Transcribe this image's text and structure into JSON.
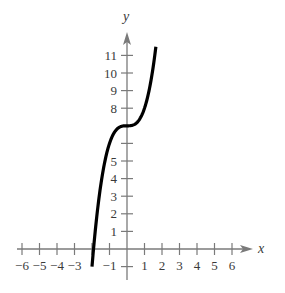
{
  "chart_data": {
    "type": "line",
    "title": "",
    "xlabel": "x",
    "ylabel": "y",
    "xlim": [
      -6.5,
      7.2
    ],
    "ylim": [
      -1.5,
      12
    ],
    "grid": false,
    "legend": null,
    "x_ticks": [
      -6,
      -5,
      -4,
      -3,
      -2,
      -1,
      1,
      2,
      3,
      4,
      5,
      6
    ],
    "x_tick_labels": [
      "-6",
      "-5",
      "-4",
      "-3",
      "",
      "-1",
      "1",
      "2",
      "3",
      "4",
      "5",
      "6"
    ],
    "y_ticks": [
      -1,
      1,
      2,
      3,
      4,
      5,
      6,
      7,
      8,
      9,
      10,
      11
    ],
    "y_tick_labels": [
      "",
      "1",
      "2",
      "3",
      "4",
      "5",
      "",
      "",
      "8",
      "9",
      "10",
      "11"
    ],
    "series": [
      {
        "name": "f(x) = x^3 + 7",
        "function": "x^3 + 7",
        "x_range": [
          -2.0,
          1.65
        ],
        "points": [
          [
            -2.0,
            -1.0
          ],
          [
            -1.9,
            0.14
          ],
          [
            -1.75,
            1.64
          ],
          [
            -1.5,
            3.63
          ],
          [
            -1.25,
            5.05
          ],
          [
            -1.0,
            6.0
          ],
          [
            -0.75,
            6.58
          ],
          [
            -0.5,
            6.88
          ],
          [
            -0.25,
            6.98
          ],
          [
            0,
            7.0
          ],
          [
            0.25,
            7.02
          ],
          [
            0.5,
            7.13
          ],
          [
            0.75,
            7.42
          ],
          [
            1.0,
            8.0
          ],
          [
            1.25,
            8.95
          ],
          [
            1.5,
            10.38
          ],
          [
            1.65,
            11.49
          ]
        ],
        "color": "#000000"
      }
    ]
  },
  "colors": {
    "axis": "#7a7a7a",
    "curve": "#000000",
    "text": "#3a3a3a"
  }
}
